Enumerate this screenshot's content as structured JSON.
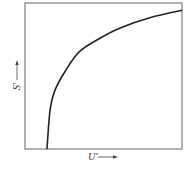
{
  "chart_data": {
    "type": "line",
    "title": "",
    "xlabel": "U'",
    "ylabel": "S'",
    "grid": false,
    "legend": null,
    "x_ticks": [],
    "y_ticks": [],
    "series": [
      {
        "name": "S'(U')",
        "x": [
          0.14,
          0.16,
          0.19,
          0.26,
          0.35,
          0.48,
          0.61,
          0.8,
          1.0
        ],
        "y": [
          0.0,
          0.27,
          0.4,
          0.54,
          0.67,
          0.76,
          0.83,
          0.9,
          0.95
        ]
      }
    ],
    "xlim": [
      0,
      1
    ],
    "ylim": [
      0,
      1
    ]
  },
  "axes": {
    "x_label": "U'",
    "y_label": "S'",
    "x_arrow": "→",
    "y_arrow": "↑"
  },
  "colors": {
    "frame": "#555555",
    "curve": "#222222",
    "label": "#333333"
  }
}
